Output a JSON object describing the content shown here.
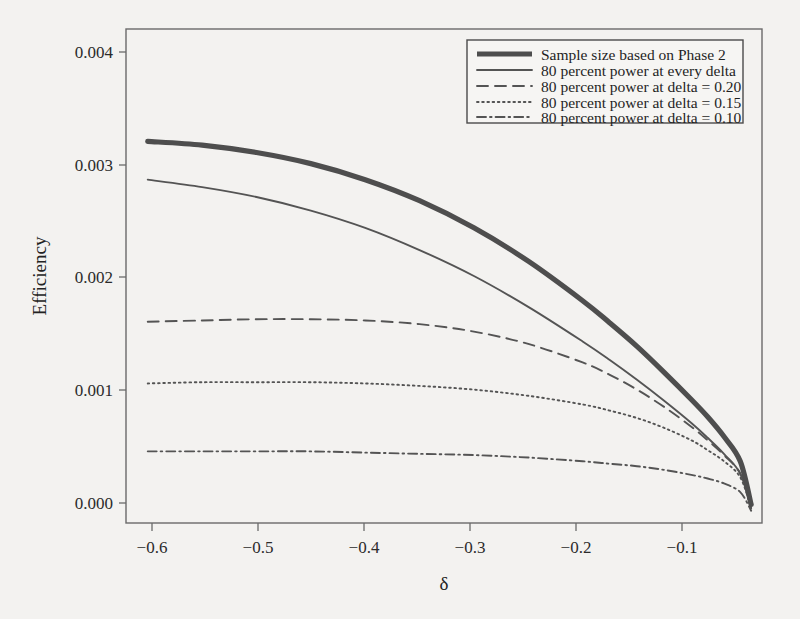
{
  "figure": {
    "background_color": "#f3f2f0",
    "frame_color": "#6a6a6a",
    "ink_color": "#4e4e4e"
  },
  "axes": {
    "x_title": "δ",
    "y_title": "Efficiency",
    "x_ticks": [
      "−0.6",
      "−0.5",
      "−0.4",
      "−0.3",
      "−0.2",
      "−0.1"
    ],
    "y_ticks": [
      "0.000",
      "0.001",
      "0.002",
      "0.003",
      "0.004"
    ]
  },
  "legend": {
    "items": [
      {
        "label": "Sample size based on Phase 2",
        "style": "thick-solid"
      },
      {
        "label": "80 percent power at every delta",
        "style": "solid"
      },
      {
        "label": "80 percent power at delta = 0.20",
        "style": "dashed"
      },
      {
        "label": "80 percent power at delta = 0.15",
        "style": "dotted"
      },
      {
        "label": "80 percent power at delta = 0.10",
        "style": "dash-dot"
      }
    ]
  },
  "chart_data": {
    "type": "line",
    "title": "",
    "xlabel": "δ",
    "ylabel": "Efficiency",
    "xlim": [
      -0.62,
      -0.035
    ],
    "ylim": [
      0.0,
      0.004
    ],
    "xticks": [
      -0.6,
      -0.5,
      -0.4,
      -0.3,
      -0.2,
      -0.1
    ],
    "yticks": [
      0.0,
      0.001,
      0.002,
      0.003,
      0.004
    ],
    "grid": false,
    "legend_position": "top-right",
    "x": [
      -0.6,
      -0.55,
      -0.5,
      -0.45,
      -0.4,
      -0.35,
      -0.3,
      -0.25,
      -0.2,
      -0.175,
      -0.15,
      -0.125,
      -0.1,
      -0.085,
      -0.07,
      -0.055,
      -0.045
    ],
    "series": [
      {
        "name": "Sample size based on Phase 2",
        "style": "thick-solid",
        "values": [
          0.00309,
          0.00306,
          0.003,
          0.00291,
          0.00278,
          0.00261,
          0.00239,
          0.00212,
          0.0018,
          0.00162,
          0.00143,
          0.00122,
          0.001,
          0.00086,
          0.0007,
          0.0005,
          0.00015
        ]
      },
      {
        "name": "80 percent power at every delta",
        "style": "solid",
        "values": [
          0.00278,
          0.00272,
          0.00264,
          0.00253,
          0.00239,
          0.00221,
          0.002,
          0.00175,
          0.00147,
          0.00132,
          0.00116,
          0.00099,
          0.00081,
          0.00069,
          0.00056,
          0.0004,
          0.00012
        ]
      },
      {
        "name": "80 percent power at delta = 0.20",
        "style": "dashed",
        "values": [
          0.00163,
          0.00164,
          0.00165,
          0.00165,
          0.00164,
          0.00161,
          0.00155,
          0.00145,
          0.0013,
          0.0012,
          0.00108,
          0.00094,
          0.00078,
          0.00067,
          0.00055,
          0.0004,
          0.00012
        ]
      },
      {
        "name": "80 percent power at delta = 0.15",
        "style": "dotted",
        "values": [
          0.00113,
          0.00114,
          0.00114,
          0.00114,
          0.00113,
          0.00111,
          0.00108,
          0.00103,
          0.00096,
          0.00091,
          0.00085,
          0.00077,
          0.00067,
          0.00059,
          0.0005,
          0.00037,
          0.00012
        ]
      },
      {
        "name": "80 percent power at delta = 0.10",
        "style": "dash-dot",
        "values": [
          0.00058,
          0.00058,
          0.00058,
          0.00058,
          0.00057,
          0.00056,
          0.00055,
          0.00053,
          0.0005,
          0.00048,
          0.00046,
          0.00043,
          0.00039,
          0.00036,
          0.00032,
          0.00025,
          0.0001
        ]
      }
    ]
  }
}
